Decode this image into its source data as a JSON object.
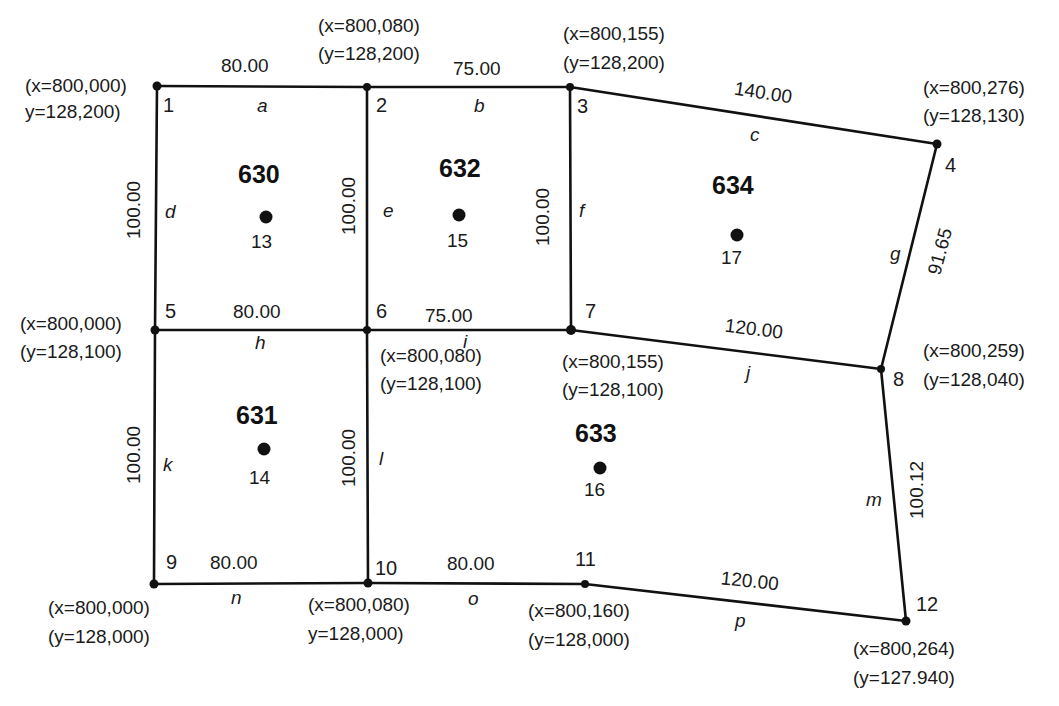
{
  "diagram": {
    "type": "cadastral-parcel-map",
    "nodes": [
      {
        "id": "1",
        "x": 157,
        "y": 86,
        "coord_x": "(x=800,000)",
        "coord_y": "y=128,200)"
      },
      {
        "id": "2",
        "x": 367,
        "y": 87,
        "coord_x": "(x=800,080)",
        "coord_y": "(y=128,200)"
      },
      {
        "id": "3",
        "x": 570,
        "y": 87,
        "coord_x": "(x=800,155)",
        "coord_y": "(y=128,200)"
      },
      {
        "id": "4",
        "x": 937,
        "y": 144,
        "coord_x": "(x=800,276)",
        "coord_y": "(y=128,130)"
      },
      {
        "id": "5",
        "x": 155,
        "y": 330,
        "coord_x": "(x=800,000)",
        "coord_y": "(y=128,100)"
      },
      {
        "id": "6",
        "x": 367,
        "y": 330,
        "coord_x": "(x=800,080)",
        "coord_y": "(y=128,100)"
      },
      {
        "id": "7",
        "x": 571,
        "y": 330,
        "coord_x": "(x=800,155)",
        "coord_y": "(y=128,100)"
      },
      {
        "id": "8",
        "x": 881,
        "y": 369,
        "coord_x": "(x=800,259)",
        "coord_y": "(y=128,040)"
      },
      {
        "id": "9",
        "x": 154,
        "y": 584,
        "coord_x": "(x=800,000)",
        "coord_y": "(y=128,000)"
      },
      {
        "id": "10",
        "x": 368,
        "y": 583,
        "coord_x": "(x=800,080)",
        "coord_y": "y=128,000)"
      },
      {
        "id": "11",
        "x": 585,
        "y": 584,
        "coord_x": "(x=800,160)",
        "coord_y": "(y=128,000)"
      },
      {
        "id": "12",
        "x": 906,
        "y": 621,
        "coord_x": "(x=800,264)",
        "coord_y": "(y=127.940)"
      }
    ],
    "edges": [
      {
        "id": "a",
        "from": "1",
        "to": "2",
        "length": "80.00"
      },
      {
        "id": "b",
        "from": "2",
        "to": "3",
        "length": "75.00"
      },
      {
        "id": "c",
        "from": "3",
        "to": "4",
        "length": "140.00"
      },
      {
        "id": "d",
        "from": "1",
        "to": "5",
        "length": "100.00"
      },
      {
        "id": "e",
        "from": "2",
        "to": "6",
        "length": "100.00"
      },
      {
        "id": "f",
        "from": "3",
        "to": "7",
        "length": "100.00"
      },
      {
        "id": "g",
        "from": "4",
        "to": "8",
        "length": "91.65"
      },
      {
        "id": "h",
        "from": "5",
        "to": "6",
        "length": "80.00"
      },
      {
        "id": "i",
        "from": "6",
        "to": "7",
        "length": "75.00"
      },
      {
        "id": "j",
        "from": "7",
        "to": "8",
        "length": "120.00"
      },
      {
        "id": "k",
        "from": "5",
        "to": "9",
        "length": "100.00"
      },
      {
        "id": "l",
        "from": "6",
        "to": "10",
        "length": "100.00"
      },
      {
        "id": "m",
        "from": "8",
        "to": "12",
        "length": "100.12"
      },
      {
        "id": "n",
        "from": "9",
        "to": "10",
        "length": "80.00"
      },
      {
        "id": "o",
        "from": "10",
        "to": "11",
        "length": "80.00"
      },
      {
        "id": "p",
        "from": "11",
        "to": "12",
        "length": "120.00"
      }
    ],
    "parcels": [
      {
        "id": "630",
        "centroid": "13"
      },
      {
        "id": "631",
        "centroid": "14"
      },
      {
        "id": "632",
        "centroid": "15"
      },
      {
        "id": "633",
        "centroid": "16"
      },
      {
        "id": "634",
        "centroid": "17"
      }
    ]
  }
}
